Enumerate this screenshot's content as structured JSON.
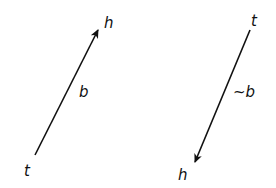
{
  "diagram": {
    "stroke_color": "#111111",
    "background": "#ffffff",
    "arrows": [
      {
        "name": "arrow-b",
        "tail_label": "t",
        "head_label": "h",
        "edge_label": "b",
        "tail": [
          35,
          155
        ],
        "head": [
          98,
          30
        ]
      },
      {
        "name": "arrow-not-b",
        "tail_label": "t",
        "head_label": "h",
        "edge_label": "~b",
        "tail": [
          250,
          30
        ],
        "head": [
          195,
          162
        ]
      }
    ]
  }
}
